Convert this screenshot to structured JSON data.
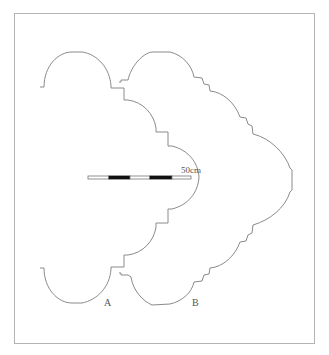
{
  "figure": {
    "type": "plan outline drawing",
    "labels": {
      "shape_a": "A",
      "shape_b": "B"
    },
    "scale_bar": {
      "label": "50cm",
      "segments": [
        "white",
        "black",
        "white",
        "black",
        "white"
      ]
    },
    "colors": {
      "outline": "#8a8a8a",
      "frame": "#b4b4b4",
      "scale_dark": "#111111"
    }
  }
}
